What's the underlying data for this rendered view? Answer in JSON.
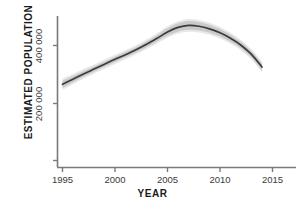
{
  "chart_data": {
    "type": "line",
    "title": "",
    "xlabel": "YEAR",
    "ylabel": "ESTIMATED POPULATION",
    "xlim": [
      1994.0,
      2016.0
    ],
    "ylim": [
      0,
      520000
    ],
    "xticks": [
      1995,
      2000,
      2005,
      2010,
      2015
    ],
    "xtick_labels": [
      "1995",
      "2000",
      "2005",
      "2010",
      "2015"
    ],
    "yticks": [
      0,
      200000,
      400000
    ],
    "ytick_labels": [
      "",
      "200 000",
      "400 000"
    ],
    "grid": false,
    "legend": null,
    "series": [
      {
        "name": "Estimated population",
        "style": "smoothed-trend-with-confidence-ribbon",
        "line_color": "#3b3b3b",
        "band_color": "#c8c8c8",
        "x": [
          1995,
          1996,
          1997,
          1998,
          1999,
          2000,
          2001,
          2002,
          2003,
          2004,
          2005,
          2006,
          2007,
          2008,
          2009,
          2010,
          2011,
          2012,
          2013,
          2014
        ],
        "values": [
          265000,
          283000,
          301000,
          318000,
          335000,
          352000,
          368000,
          385000,
          404000,
          425000,
          447000,
          463000,
          470000,
          467000,
          458000,
          444000,
          425000,
          401000,
          369000,
          325000
        ],
        "lower": [
          252000,
          272000,
          291000,
          309000,
          326000,
          343000,
          359000,
          376000,
          394000,
          414000,
          434000,
          449000,
          455000,
          452000,
          444000,
          431000,
          413000,
          390000,
          358000,
          313000
        ],
        "upper": [
          278000,
          294000,
          311000,
          327000,
          344000,
          361000,
          377000,
          394000,
          414000,
          436000,
          460000,
          477000,
          485000,
          482000,
          472000,
          457000,
          437000,
          412000,
          380000,
          337000
        ]
      }
    ],
    "annotations": []
  },
  "axes": {
    "x_title": "YEAR",
    "y_title": "ESTIMATED POPULATION",
    "x_tick_labels": [
      "1995",
      "2000",
      "2005",
      "2010",
      "2015"
    ],
    "y_tick_labels": [
      "200 000",
      "400 000"
    ]
  },
  "colors": {
    "line": "#3b3b3b",
    "band": "#c9c9c9",
    "axis": "#7a7a7a",
    "text": "#1b1b1b",
    "tick_text": "#3a3a3a",
    "background": "#ffffff"
  }
}
